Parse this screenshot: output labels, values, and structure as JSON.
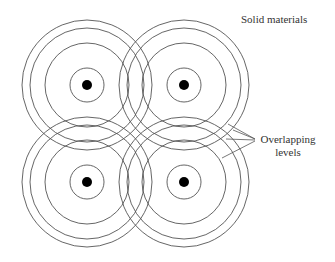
{
  "diagram": {
    "title": "Solid materials",
    "annotation": {
      "line1": "Overlapping",
      "line2": "levels"
    },
    "atoms": [
      {
        "cx": 87,
        "cy": 85
      },
      {
        "cx": 184,
        "cy": 85
      },
      {
        "cx": 87,
        "cy": 182
      },
      {
        "cx": 184,
        "cy": 182
      }
    ],
    "ring_radii": [
      17,
      42,
      57,
      65
    ],
    "nucleus_radius": 5,
    "stroke_color": "#555555",
    "nucleus_color": "#000000"
  }
}
